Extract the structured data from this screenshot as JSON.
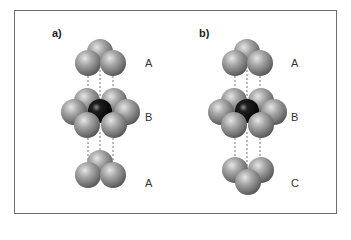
{
  "figure": {
    "panels": [
      {
        "id": "a",
        "label": "a)",
        "sequence": "ABA",
        "layers": [
          {
            "label": "A",
            "position": "top",
            "spheres": 3
          },
          {
            "label": "B",
            "position": "middle",
            "spheres": 6,
            "center_atom": "dark"
          },
          {
            "label": "A",
            "position": "bottom",
            "spheres": 3
          }
        ]
      },
      {
        "id": "b",
        "label": "b)",
        "sequence": "ABC",
        "layers": [
          {
            "label": "A",
            "position": "top",
            "spheres": 3
          },
          {
            "label": "B",
            "position": "middle",
            "spheres": 6,
            "center_atom": "dark"
          },
          {
            "label": "C",
            "position": "bottom",
            "spheres": 3
          }
        ]
      }
    ],
    "colors": {
      "sphere_light": "#c9c9c9",
      "sphere_mid": "#8a8a8a",
      "sphere_dark": "#4a4a4a",
      "center_atom": "#0a0a0a",
      "frame": "#6e6e6e",
      "dashes": "#777777"
    }
  }
}
